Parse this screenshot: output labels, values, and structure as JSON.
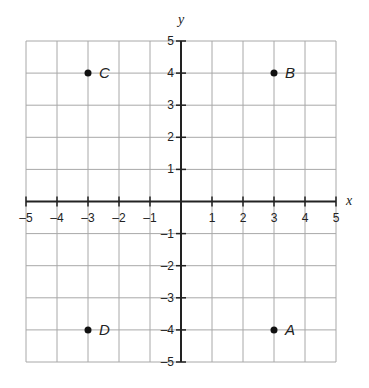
{
  "chart_data": {
    "type": "scatter",
    "title": "",
    "xlabel": "x",
    "ylabel": "y",
    "xlim": [
      -5,
      5
    ],
    "ylim": [
      -5,
      5
    ],
    "grid": true,
    "legend": null,
    "x_ticks": [
      -5,
      -4,
      -3,
      -2,
      -1,
      1,
      2,
      3,
      4,
      5
    ],
    "y_ticks": [
      5,
      4,
      3,
      2,
      1,
      -1,
      -2,
      -3,
      -4,
      -5
    ],
    "x_tick_labels": [
      "–5",
      "–4",
      "–3",
      "–2",
      "–1",
      "1",
      "2",
      "3",
      "4",
      "5"
    ],
    "y_tick_labels": [
      "5",
      "4",
      "3",
      "2",
      "1",
      "–1",
      "–2",
      "–3",
      "–4",
      "–5"
    ],
    "points": [
      {
        "label": "A",
        "x": 3,
        "y": -4
      },
      {
        "label": "B",
        "x": 3,
        "y": 4
      },
      {
        "label": "C",
        "x": -3,
        "y": 4
      },
      {
        "label": "D",
        "x": -3,
        "y": -4
      }
    ]
  },
  "colors": {
    "grid": "#a8a8a8",
    "axis": "#222222",
    "point": "#111111"
  }
}
